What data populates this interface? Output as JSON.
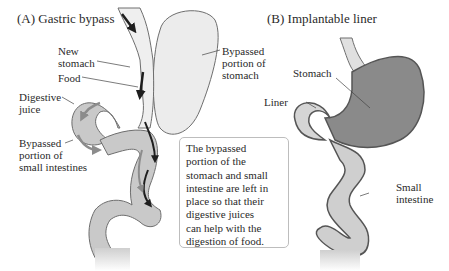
{
  "panels": {
    "a": {
      "title": "(A)  Gastric bypass",
      "labels": {
        "new_stomach": [
          "New",
          "stomach"
        ],
        "food": "Food",
        "digestive_juice": [
          "Digestive",
          "juice"
        ],
        "bypassed_intestines": [
          "Bypassed",
          "portion of",
          "small intestines"
        ],
        "bypassed_stomach": [
          "Bypassed",
          "portion of",
          "stomach"
        ]
      },
      "callout": [
        "The bypassed",
        "portion of the",
        "stomach and small",
        "intestine are left in",
        "place so that their",
        "digestive juices",
        "can help with the",
        "digestion of food."
      ]
    },
    "b": {
      "title": "(B)  Implantable liner",
      "labels": {
        "stomach": "Stomach",
        "liner": "Liner",
        "small_intestine": [
          "Small",
          "intestine"
        ]
      }
    }
  },
  "colors": {
    "tissue_light": "#e6e6e6",
    "tissue_mid": "#c9c9c9",
    "stomach_dark": "#8a8a8a",
    "outline": "#6e6e6e",
    "arrow_dark": "#1e1e1e",
    "arrow_gray": "#8c8c8c"
  }
}
